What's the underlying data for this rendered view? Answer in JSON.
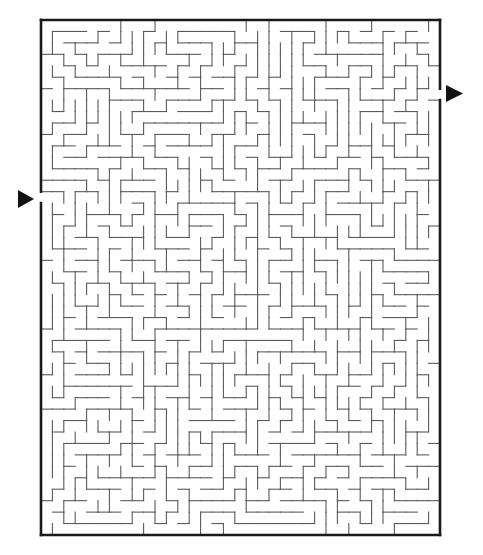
{
  "puzzle": {
    "type": "maze",
    "title": "Rectangular maze puzzle",
    "background_color": "#ffffff",
    "wall_color": "#5a5a5a",
    "border_color": "#1a1a1a",
    "arrow_color": "#111111"
  },
  "maze": {
    "frame": {
      "left": 41,
      "top": 20,
      "right": 440,
      "bottom": 535
    },
    "columns": 35,
    "rows": 45,
    "seed": 9173,
    "entrance": {
      "side": "left",
      "row": 15,
      "label": "start",
      "arrow_direction": "right",
      "arrow": {
        "x1": 18,
        "y_top": 190,
        "y_bottom": 208,
        "tip_x": 34
      }
    },
    "exit": {
      "side": "right",
      "row": 6,
      "label": "finish",
      "arrow_direction": "right",
      "arrow": {
        "x1": 446,
        "y_top": 85,
        "y_bottom": 102,
        "tip_x": 463
      }
    }
  }
}
